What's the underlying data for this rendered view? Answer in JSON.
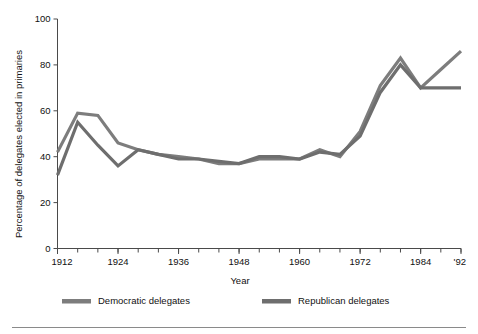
{
  "chart_data": {
    "type": "line",
    "title": "",
    "xlabel": "Year",
    "ylabel": "Percentage of delegates elected in primaries",
    "xlim": [
      1912,
      1992
    ],
    "ylim": [
      0,
      100
    ],
    "grid": false,
    "legend_position": "bottom",
    "x_tick_labels": [
      "1912",
      "1924",
      "1936",
      "1948",
      "1960",
      "1972",
      "1984",
      "'92"
    ],
    "x_tick_values": [
      1912,
      1924,
      1936,
      1948,
      1960,
      1972,
      1984,
      1992
    ],
    "x_minor_tick_step": 4,
    "y_tick_labels": [
      "0",
      "20",
      "40",
      "60",
      "80",
      "100"
    ],
    "y_tick_values": [
      0,
      20,
      40,
      60,
      80,
      100
    ],
    "x": [
      1912,
      1916,
      1920,
      1924,
      1928,
      1932,
      1936,
      1940,
      1944,
      1948,
      1952,
      1956,
      1960,
      1964,
      1968,
      1972,
      1976,
      1980,
      1984,
      1988,
      1992
    ],
    "series": [
      {
        "name": "Democratic delegates",
        "color": "#7d7d7d",
        "values": [
          42,
          59,
          58,
          46,
          43,
          41,
          40,
          39,
          37,
          37,
          39,
          39,
          39,
          43,
          40,
          51,
          71,
          83,
          70,
          78,
          86
        ]
      },
      {
        "name": "Republican delegates",
        "color": "#6e6e6e",
        "values": [
          32,
          55,
          45,
          36,
          43,
          41,
          39,
          39,
          38,
          37,
          40,
          40,
          39,
          42,
          41,
          49,
          68,
          80,
          70,
          70,
          70
        ]
      }
    ]
  },
  "axes": {
    "y_axis_title": "Percentage of delegates elected in primaries",
    "x_axis_title": "Year"
  },
  "legend": {
    "items": [
      {
        "label": "Democratic delegates",
        "swatch_color": "#7d7d7d"
      },
      {
        "label": "Republican delegates",
        "swatch_color": "#6e6e6e"
      }
    ]
  }
}
